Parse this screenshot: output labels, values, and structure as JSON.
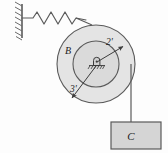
{
  "figure": {
    "background_color": "#fdfdfd",
    "line_color": "#555555",
    "fill_light": "#e3e3e3",
    "fill_mid": "#d8d8d8",
    "fill_block": "#d5d5d5",
    "text_color": "#1c1c1c"
  },
  "labels": {
    "pulley_outer": "B",
    "radius_inner": "2'",
    "radius_outer": "3'",
    "block": "C"
  },
  "components": {
    "wall": {
      "name": "fixed-wall-support",
      "hatch_count": 8,
      "x": 22,
      "y_top": 4,
      "y_bottom": 38
    },
    "spring": {
      "name": "spring",
      "coil_peaks": 4,
      "x_start": 23,
      "x_end": 80,
      "y": 18
    },
    "pulley": {
      "name": "stepped-pulley",
      "center_x": 96,
      "center_y": 64,
      "outer_radius": 39,
      "inner_radius": 23
    },
    "pivot": {
      "name": "pin-support-pivot",
      "x": 100,
      "y": 64
    },
    "cord": {
      "name": "cord-to-block",
      "x": 131,
      "y_top": 64,
      "y_bottom": 122
    },
    "block": {
      "name": "hanging-block",
      "x": 111,
      "y": 122,
      "width": 50,
      "height": 27
    }
  },
  "dimension_arrows": [
    {
      "name": "inner-radius-arrow",
      "label": "2'",
      "from_x": 96,
      "from_y": 64,
      "to_x": 124,
      "to_y": 47
    },
    {
      "name": "outer-radius-arrow",
      "label": "3'",
      "from_x": 96,
      "from_y": 64,
      "to_x": 71,
      "to_y": 99
    }
  ]
}
